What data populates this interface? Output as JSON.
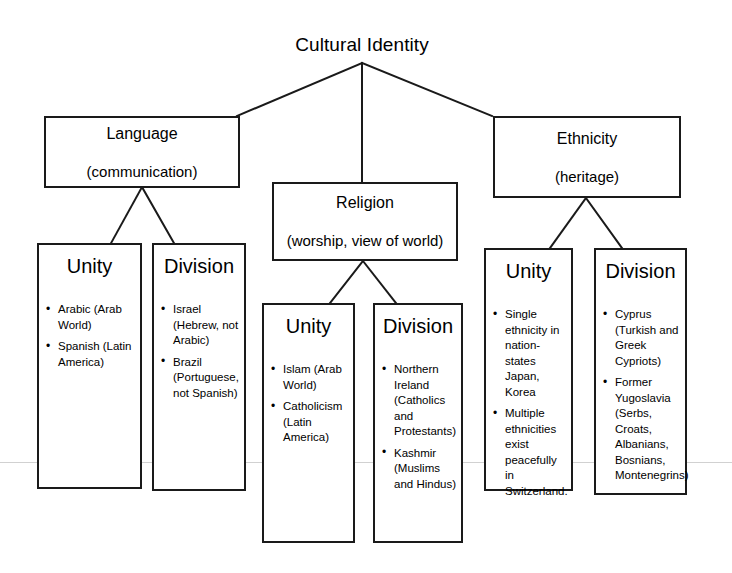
{
  "diagram": {
    "root": {
      "label": "Cultural Identity"
    },
    "branches": [
      {
        "id": "language",
        "title": "Language",
        "subtitle": "(communication)",
        "children": [
          {
            "id": "language-unity",
            "title": "Unity",
            "items": [
              "Arabic (Arab World)",
              "Spanish (Latin America)"
            ]
          },
          {
            "id": "language-division",
            "title": "Division",
            "items": [
              "Israel (Hebrew, not Arabic)",
              "Brazil (Portuguese, not Spanish)"
            ]
          }
        ]
      },
      {
        "id": "religion",
        "title": "Religion",
        "subtitle": "(worship, view of world)",
        "children": [
          {
            "id": "religion-unity",
            "title": "Unity",
            "items": [
              "Islam (Arab World)",
              "Catholicism (Latin America)"
            ]
          },
          {
            "id": "religion-division",
            "title": "Division",
            "items": [
              "Northern Ireland (Catholics and Protestants)",
              "Kashmir (Muslims and Hindus)"
            ]
          }
        ]
      },
      {
        "id": "ethnicity",
        "title": "Ethnicity",
        "subtitle": "(heritage)",
        "children": [
          {
            "id": "ethnicity-unity",
            "title": "Unity",
            "items": [
              "Single ethnicity in nation-states Japan, Korea",
              "Multiple ethnicities exist peacefully in Switzerland."
            ]
          },
          {
            "id": "ethnicity-division",
            "title": "Division",
            "items": [
              "Cyprus (Turkish and Greek Cypriots)",
              "Former Yugoslavia (Serbs, Croats, Albanians, Bosnians, Montenegrins)"
            ]
          }
        ]
      }
    ],
    "colors": {
      "border": "#1a1a1a",
      "text": "#000000",
      "background": "#ffffff"
    }
  }
}
